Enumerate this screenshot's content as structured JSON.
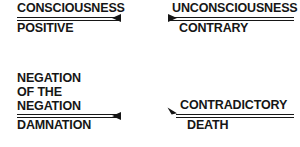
{
  "diagram": {
    "type": "dialectical-square",
    "background_color": "#ffffff",
    "ink_color": "#161616",
    "terms": [
      {
        "id": "consciousness",
        "position": "top-left",
        "numerator_lines": [
          "CONSCIOUSNESS"
        ],
        "denominator": "POSITIVE",
        "rule": "double",
        "arrow": "point-left",
        "arrow_icon": "arrow-left-icon"
      },
      {
        "id": "unconsciousness",
        "position": "top-right",
        "numerator_lines": [
          "UNCONSCIOUSNESS"
        ],
        "denominator": "CONTRARY",
        "rule": "double",
        "arrow": "point-right",
        "arrow_icon": "arrow-right-icon"
      },
      {
        "id": "negation",
        "position": "bottom-left",
        "numerator_lines": [
          "NEGATION",
          "OF THE",
          "NEGATION"
        ],
        "denominator": "DAMNATION",
        "rule": "double",
        "arrow": "point-left",
        "arrow_icon": "arrow-left-icon"
      },
      {
        "id": "contradictory",
        "position": "bottom-right",
        "numerator_lines": [
          "CONTRADICTORY"
        ],
        "denominator": "DEATH",
        "rule": "double",
        "arrow": "point-up-left-diagonal",
        "arrow_icon": "arrow-up-left-icon"
      }
    ]
  }
}
